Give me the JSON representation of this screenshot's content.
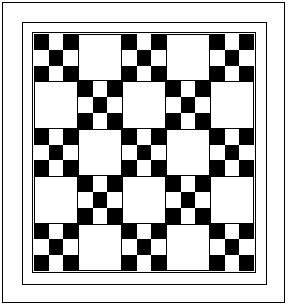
{
  "figure": {
    "title": "Nine-Patch Quilt Block Layout Diagram",
    "caption": "",
    "background_color": "#ffffff",
    "line_color": "#000000",
    "dark_color": "#000000",
    "light_color": "#ffffff"
  },
  "frames": [
    {
      "name": "outer-frame",
      "label": "Outer frame"
    },
    {
      "name": "outer-border",
      "label": "Outer border"
    },
    {
      "name": "inner-border",
      "label": "Inner border"
    }
  ],
  "chart_data": {
    "type": "heatmap",
    "title": "Nine-Patch Quilt Block Layout Diagram",
    "xlabel": "",
    "ylabel": "",
    "grid": true,
    "legend_position": "none",
    "rows": 5,
    "columns": 5,
    "block_types": {
      "N": "nine-patch",
      "P": "plain"
    },
    "categories": [
      "Col 1",
      "Col 2",
      "Col 3",
      "Col 4",
      "Col 5"
    ],
    "row_labels": [
      "Row 1",
      "Row 2",
      "Row 3",
      "Row 4",
      "Row 5"
    ],
    "layout": [
      [
        "N",
        "P",
        "N",
        "P",
        "N"
      ],
      [
        "P",
        "N",
        "P",
        "N",
        "P"
      ],
      [
        "N",
        "P",
        "N",
        "P",
        "N"
      ],
      [
        "P",
        "N",
        "P",
        "N",
        "P"
      ],
      [
        "N",
        "P",
        "N",
        "P",
        "N"
      ]
    ],
    "nine_patch_cells": [
      [
        "dark",
        "light",
        "dark"
      ],
      [
        "light",
        "dark",
        "light"
      ],
      [
        "dark",
        "light",
        "dark"
      ]
    ],
    "counts": {
      "nine_patch_blocks": 13,
      "plain_blocks": 12,
      "total_blocks": 25
    },
    "values": [
      [
        1,
        0,
        1,
        0,
        1
      ],
      [
        0,
        1,
        0,
        1,
        0
      ],
      [
        1,
        0,
        1,
        0,
        1
      ],
      [
        0,
        1,
        0,
        1,
        0
      ],
      [
        1,
        0,
        1,
        0,
        1
      ]
    ]
  }
}
